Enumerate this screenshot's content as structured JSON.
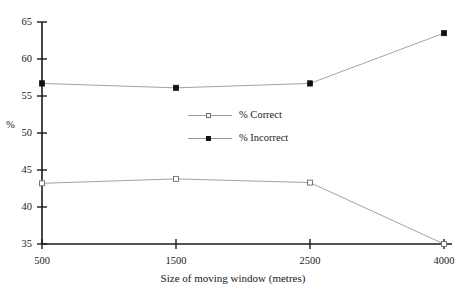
{
  "chart_data": {
    "type": "line",
    "title": "",
    "xlabel": "Size of moving window (metres)",
    "ylabel": "%",
    "categories": [
      "500",
      "1500",
      "2500",
      "4000"
    ],
    "x_tick_labels": [
      "500",
      "1500",
      "2500",
      "4000"
    ],
    "y_tick_labels": [
      "35",
      "40",
      "45",
      "50",
      "55",
      "60",
      "65"
    ],
    "y_ticks": [
      35,
      40,
      45,
      50,
      55,
      60,
      65
    ],
    "ylim": [
      35,
      65
    ],
    "grid": false,
    "legend_position": "center",
    "series": [
      {
        "name": "% Correct",
        "marker": "open-square",
        "color": "#9a9a9a",
        "values": [
          43.2,
          43.8,
          43.3,
          35.0
        ]
      },
      {
        "name": "% Incorrect",
        "marker": "filled-square",
        "color": "#9a9a9a",
        "values": [
          56.7,
          56.1,
          56.7,
          63.5
        ]
      }
    ]
  },
  "legend": {
    "items": [
      {
        "label": "% Correct"
      },
      {
        "label": "% Incorrect"
      }
    ]
  },
  "axes": {
    "x_title": "Size of moving window (metres)",
    "y_title": "%"
  },
  "colors": {
    "axis": "#1a1a1a",
    "series_line": "#9a9a9a",
    "marker_filled": "#111111",
    "marker_open_border": "#6b6b6b",
    "background": "#ffffff"
  }
}
